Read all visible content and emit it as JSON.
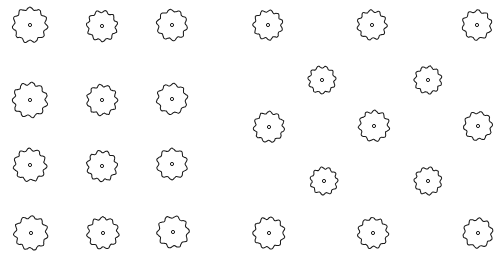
{
  "document": {
    "title": "Tree Planting Plan",
    "drawing_type": "site-plan",
    "background_color": "#ffffff",
    "stroke_color": "#1a1a1a",
    "fill_color": "#ffffff",
    "width": 502,
    "height": 263
  },
  "symbol": {
    "name": "tree-canopy-plan-symbol",
    "description": "scalloped circle with center trunk dot",
    "lobe_count": 11,
    "trunk_dot_radius": 1.6,
    "outline_stroke_width": 1.05
  },
  "groves": [
    {
      "name": "left-orthogonal-grove",
      "layout": "orthogonal-grid",
      "columns": 3,
      "rows": 4,
      "tree_count": 12
    },
    {
      "name": "right-staggered-grove",
      "layout": "staggered-grid",
      "columns": 3,
      "rows": 4,
      "tree_count": 12
    }
  ],
  "totals": {
    "tree_count": 24,
    "left_count": 12,
    "right_count": 12
  },
  "trees": [
    {
      "id": "L-R1-C1",
      "grove": "left-orthogonal-grove",
      "row": 1,
      "col": 1,
      "cx": 30,
      "cy": 25,
      "r": 16.5,
      "lobes": 11,
      "rot": 8,
      "jx": 0.0,
      "jy": 0.0
    },
    {
      "id": "L-R1-C2",
      "grove": "left-orthogonal-grove",
      "row": 1,
      "col": 2,
      "cx": 102,
      "cy": 26,
      "r": 14.5,
      "lobes": 11,
      "rot": 22,
      "jx": 0.0,
      "jy": 0.0
    },
    {
      "id": "L-R1-C3",
      "grove": "left-orthogonal-grove",
      "row": 1,
      "col": 3,
      "cx": 172,
      "cy": 25,
      "r": 14.5,
      "lobes": 10,
      "rot": 47,
      "jx": 0.0,
      "jy": 0.0
    },
    {
      "id": "L-R2-C1",
      "grove": "left-orthogonal-grove",
      "row": 2,
      "col": 1,
      "cx": 30,
      "cy": 100,
      "r": 16.5,
      "lobes": 11,
      "rot": 15,
      "jx": 0.0,
      "jy": 0.0
    },
    {
      "id": "L-R2-C2",
      "grove": "left-orthogonal-grove",
      "row": 2,
      "col": 2,
      "cx": 102,
      "cy": 100,
      "r": 14.5,
      "lobes": 11,
      "rot": 33,
      "jx": 0.0,
      "jy": 0.0
    },
    {
      "id": "L-R2-C3",
      "grove": "left-orthogonal-grove",
      "row": 2,
      "col": 3,
      "cx": 172,
      "cy": 99,
      "r": 14.5,
      "lobes": 10,
      "rot": 62,
      "jx": 0.0,
      "jy": 0.0
    },
    {
      "id": "L-R3-C1",
      "grove": "left-orthogonal-grove",
      "row": 3,
      "col": 1,
      "cx": 30,
      "cy": 165,
      "r": 15.5,
      "lobes": 11,
      "rot": 5,
      "jx": 0.0,
      "jy": 0.0
    },
    {
      "id": "L-R3-C2",
      "grove": "left-orthogonal-grove",
      "row": 3,
      "col": 2,
      "cx": 102,
      "cy": 166,
      "r": 14.5,
      "lobes": 11,
      "rot": 28,
      "jx": 0.0,
      "jy": 0.0
    },
    {
      "id": "L-R3-C3",
      "grove": "left-orthogonal-grove",
      "row": 3,
      "col": 3,
      "cx": 172,
      "cy": 164,
      "r": 14.5,
      "lobes": 10,
      "rot": 54,
      "jx": 0.0,
      "jy": 0.0
    },
    {
      "id": "L-R4-C1",
      "grove": "left-orthogonal-grove",
      "row": 4,
      "col": 1,
      "cx": 31,
      "cy": 233,
      "r": 16.0,
      "lobes": 11,
      "rot": 12,
      "jx": 0.0,
      "jy": 0.0
    },
    {
      "id": "L-R4-C2",
      "grove": "left-orthogonal-grove",
      "row": 4,
      "col": 2,
      "cx": 103,
      "cy": 233,
      "r": 15.0,
      "lobes": 11,
      "rot": 40,
      "jx": 0.0,
      "jy": 0.0
    },
    {
      "id": "L-R4-C3",
      "grove": "left-orthogonal-grove",
      "row": 4,
      "col": 3,
      "cx": 173,
      "cy": 232,
      "r": 15.0,
      "lobes": 10,
      "rot": 68,
      "jx": 0.0,
      "jy": 0.0
    },
    {
      "id": "R-R1-C1",
      "grove": "right-staggered-grove",
      "row": 1,
      "col": 1,
      "cx": 268,
      "cy": 25,
      "r": 14.0,
      "lobes": 11,
      "rot": 18,
      "jx": 0.0,
      "jy": 0.0
    },
    {
      "id": "R-R1-C2",
      "grove": "right-staggered-grove",
      "row": 1,
      "col": 2,
      "cx": 372,
      "cy": 25,
      "r": 14.0,
      "lobes": 11,
      "rot": 36,
      "jx": 0.0,
      "jy": 0.0
    },
    {
      "id": "R-R1-C3",
      "grove": "right-staggered-grove",
      "row": 1,
      "col": 3,
      "cx": 477,
      "cy": 25,
      "r": 14.0,
      "lobes": 10,
      "rot": 58,
      "jx": 0.0,
      "jy": 0.0
    },
    {
      "id": "R-R2-C1",
      "grove": "right-staggered-grove",
      "row": 2,
      "col": 1,
      "cx": 322,
      "cy": 80,
      "r": 13.0,
      "lobes": 11,
      "rot": 25,
      "jx": 0.0,
      "jy": 0.0
    },
    {
      "id": "R-R2-C2",
      "grove": "right-staggered-grove",
      "row": 2,
      "col": 2,
      "cx": 428,
      "cy": 80,
      "r": 13.0,
      "lobes": 11,
      "rot": 50,
      "jx": 0.0,
      "jy": 0.0
    },
    {
      "id": "R-R3-C1",
      "grove": "right-staggered-grove",
      "row": 3,
      "col": 1,
      "cx": 269,
      "cy": 127,
      "r": 14.5,
      "lobes": 11,
      "rot": 10,
      "jx": 0.0,
      "jy": 0.0
    },
    {
      "id": "R-R3-C2",
      "grove": "right-staggered-grove",
      "row": 3,
      "col": 2,
      "cx": 374,
      "cy": 126,
      "r": 14.5,
      "lobes": 11,
      "rot": 44,
      "jx": 0.0,
      "jy": 0.0
    },
    {
      "id": "R-R3-C3",
      "grove": "right-staggered-grove",
      "row": 3,
      "col": 3,
      "cx": 478,
      "cy": 126,
      "r": 13.5,
      "lobes": 10,
      "rot": 66,
      "jx": 0.0,
      "jy": 0.0
    },
    {
      "id": "R-R4-C1",
      "grove": "right-staggered-grove",
      "row": 4,
      "col": 1,
      "cx": 324,
      "cy": 181,
      "r": 13.0,
      "lobes": 11,
      "rot": 30,
      "jx": 0.0,
      "jy": 0.0
    },
    {
      "id": "R-R4-C2",
      "grove": "right-staggered-grove",
      "row": 4,
      "col": 2,
      "cx": 428,
      "cy": 181,
      "r": 13.0,
      "lobes": 11,
      "rot": 52,
      "jx": 0.0,
      "jy": 0.0
    },
    {
      "id": "R-R5-C1",
      "grove": "right-staggered-grove",
      "row": 5,
      "col": 1,
      "cx": 269,
      "cy": 233,
      "r": 15.0,
      "lobes": 11,
      "rot": 16,
      "jx": 0.0,
      "jy": 0.0
    },
    {
      "id": "R-R5-C2",
      "grove": "right-staggered-grove",
      "row": 5,
      "col": 2,
      "cx": 373,
      "cy": 233,
      "r": 14.5,
      "lobes": 11,
      "rot": 38,
      "jx": 0.0,
      "jy": 0.0
    },
    {
      "id": "R-R5-C3",
      "grove": "right-staggered-grove",
      "row": 5,
      "col": 3,
      "cx": 478,
      "cy": 233,
      "r": 14.0,
      "lobes": 10,
      "rot": 60,
      "jx": 0.0,
      "jy": 0.0
    }
  ]
}
